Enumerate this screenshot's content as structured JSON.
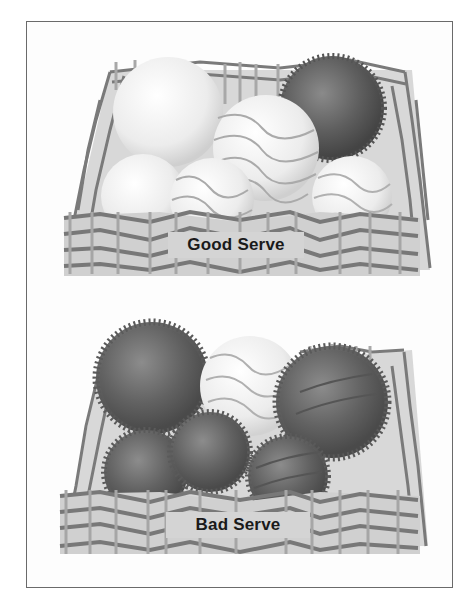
{
  "figure": {
    "type": "illustration",
    "style": "grayscale textbook figure",
    "panels": [
      {
        "id": "good",
        "label": "Good Serve",
        "description": "Basket holding mostly smooth light balls with one dark spiky ball",
        "balls": [
          {
            "texture": "smooth",
            "tone": "light",
            "pattern": "plain"
          },
          {
            "texture": "spiky",
            "tone": "dark",
            "pattern": "plain"
          },
          {
            "texture": "smooth",
            "tone": "light",
            "pattern": "wavy-lines"
          },
          {
            "texture": "smooth",
            "tone": "light",
            "pattern": "plain"
          },
          {
            "texture": "smooth",
            "tone": "light",
            "pattern": "wavy-lines"
          },
          {
            "texture": "smooth",
            "tone": "light",
            "pattern": "wavy-lines"
          }
        ]
      },
      {
        "id": "bad",
        "label": "Bad Serve",
        "description": "Basket holding mostly dark spiky balls with one smooth light ball",
        "balls": [
          {
            "texture": "spiky",
            "tone": "dark",
            "pattern": "plain"
          },
          {
            "texture": "smooth",
            "tone": "light",
            "pattern": "wavy-lines"
          },
          {
            "texture": "spiky",
            "tone": "dark",
            "pattern": "wavy-lines"
          },
          {
            "texture": "spiky",
            "tone": "dark",
            "pattern": "plain"
          },
          {
            "texture": "spiky",
            "tone": "dark",
            "pattern": "plain"
          },
          {
            "texture": "spiky",
            "tone": "dark",
            "pattern": "wavy-lines"
          }
        ]
      }
    ],
    "colors": {
      "frame": "#6a6a6a",
      "wicker": "#7a7a7a",
      "wicker_light": "#a8a8a8",
      "basket_fill": "#cfcfcf",
      "label_bg": "#d4d4d4",
      "label_text": "#1a1a1a",
      "ball_light": "#f2f2f2",
      "ball_dark": "#5a5a5a"
    }
  }
}
